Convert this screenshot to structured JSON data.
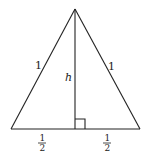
{
  "diagram": {
    "type": "equilateral-triangle-with-altitude",
    "vertices": {
      "apex": {
        "x": 75,
        "y": 9
      },
      "bottom_left": {
        "x": 11,
        "y": 129
      },
      "bottom_right": {
        "x": 140,
        "y": 129
      },
      "foot": {
        "x": 75,
        "y": 129
      }
    },
    "labels": {
      "left_side": "1",
      "right_side": "1",
      "height": "h",
      "left_half_num": "1",
      "left_half_den": "2",
      "right_half_num": "1",
      "right_half_den": "2"
    },
    "right_angle_marker": {
      "size": 10
    },
    "colors": {
      "stroke": "#222222",
      "background": "#ffffff"
    }
  }
}
